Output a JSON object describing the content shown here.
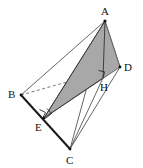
{
  "figure": {
    "kind": "geometry-diagram",
    "background_color": "#ffffff",
    "line_color": "#4a4a4a",
    "bold_line_color": "#1a1a1a",
    "shade_fill": "#a8a8a8",
    "shade_stroke": "#555555",
    "label_color": "#111111",
    "width": 143,
    "height": 168,
    "vertices": [
      {
        "name": "A",
        "label": "A",
        "x": 105,
        "y": 21,
        "label_x": 101,
        "label_y": 15
      },
      {
        "name": "B",
        "label": "B",
        "x": 21,
        "y": 95,
        "label_x": 8,
        "label_y": 98
      },
      {
        "name": "C",
        "label": "C",
        "x": 70,
        "y": 149,
        "label_x": 66,
        "label_y": 164
      },
      {
        "name": "D",
        "label": "D",
        "x": 120,
        "y": 67,
        "label_x": 124,
        "label_y": 70
      },
      {
        "name": "E",
        "label": "E",
        "x": 44,
        "y": 118,
        "label_x": 35,
        "label_y": 131
      },
      {
        "name": "H",
        "label": "H",
        "x": 103,
        "y": 78,
        "label_x": 100,
        "label_y": 91
      }
    ],
    "edges": [
      {
        "name": "edge-A-B",
        "from": "A",
        "to": "B",
        "style": "solid",
        "weight": "thin"
      },
      {
        "name": "edge-A-C",
        "from": "A",
        "to": "C",
        "style": "solid",
        "weight": "thin"
      },
      {
        "name": "edge-A-D",
        "from": "A",
        "to": "D",
        "style": "solid",
        "weight": "thin"
      },
      {
        "name": "edge-A-E",
        "from": "A",
        "to": "E",
        "style": "solid",
        "weight": "thin"
      },
      {
        "name": "edge-A-H",
        "from": "A",
        "to": "H",
        "style": "solid",
        "weight": "thin"
      },
      {
        "name": "edge-B-C",
        "from": "B",
        "to": "C",
        "style": "solid",
        "weight": "bold"
      },
      {
        "name": "edge-B-D",
        "from": "B",
        "to": "D",
        "style": "dashed",
        "weight": "thin"
      },
      {
        "name": "edge-C-D",
        "from": "C",
        "to": "D",
        "style": "solid",
        "weight": "thin"
      },
      {
        "name": "edge-E-D",
        "from": "E",
        "to": "D",
        "style": "solid",
        "weight": "thin"
      },
      {
        "name": "edge-E-H",
        "from": "E",
        "to": "H",
        "style": "solid",
        "weight": "thin"
      },
      {
        "name": "edge-H-C",
        "from": "H",
        "to": "C",
        "style": "solid",
        "weight": "thin"
      }
    ],
    "shaded_region": {
      "name": "shaded-triangle-AED",
      "vertices": [
        "A",
        "E",
        "D"
      ],
      "fill": "#a8a8a8",
      "opacity": 0.95
    },
    "right_angle_marks": [
      {
        "name": "right-angle-mark-at-E",
        "at": "E",
        "size": 6
      },
      {
        "name": "right-angle-mark-at-E-2",
        "at": "E",
        "size": 6
      },
      {
        "name": "right-angle-mark-at-H",
        "at": "H",
        "size": 6
      }
    ]
  }
}
